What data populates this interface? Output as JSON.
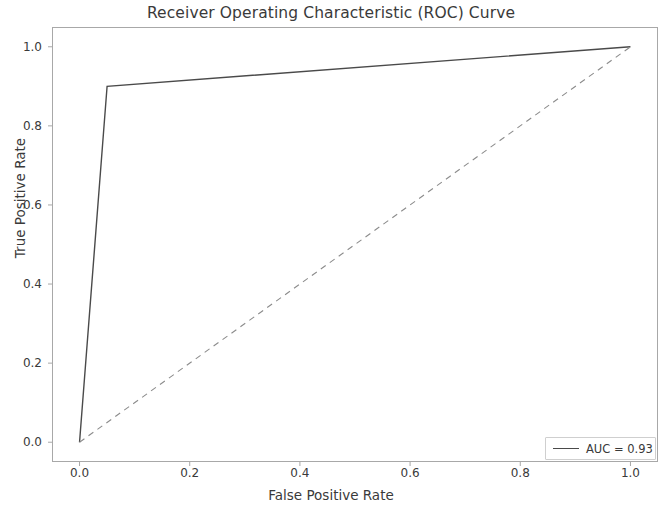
{
  "chart_data": {
    "type": "line",
    "title": "Receiver Operating Characteristic (ROC) Curve",
    "xlabel": "False Positive Rate",
    "ylabel": "True Positive Rate",
    "xlim": [
      -0.05,
      1.05
    ],
    "ylim": [
      -0.05,
      1.05
    ],
    "xticks": [
      "0.0",
      "0.2",
      "0.4",
      "0.6",
      "0.8",
      "1.0"
    ],
    "xtick_values": [
      0.0,
      0.2,
      0.4,
      0.6,
      0.8,
      1.0
    ],
    "yticks": [
      "0.0",
      "0.2",
      "0.4",
      "0.6",
      "0.8",
      "1.0"
    ],
    "ytick_values": [
      0.0,
      0.2,
      0.4,
      0.6,
      0.8,
      1.0
    ],
    "grid": false,
    "legend_position": "lower right",
    "series": [
      {
        "name": "AUC = 0.93",
        "style": "solid",
        "color": "#4a4a4a",
        "linewidth": 1.4,
        "x": [
          0.0,
          0.05,
          1.0
        ],
        "y": [
          0.0,
          0.9,
          1.0
        ]
      },
      {
        "name": "chance-diagonal",
        "style": "dashed",
        "color": "#8c8c8c",
        "linewidth": 1.1,
        "x": [
          0.0,
          1.0
        ],
        "y": [
          0.0,
          1.0
        ]
      }
    ],
    "annotations": {
      "auc_value": 0.93
    }
  },
  "legend": {
    "entries": [
      {
        "label": "AUC = 0.93",
        "color": "#4a4a4a",
        "style": "solid"
      }
    ]
  },
  "axes": {
    "spine_color": "#a8a8a8",
    "tick_color": "#a8a8a8",
    "background": "#ffffff"
  }
}
